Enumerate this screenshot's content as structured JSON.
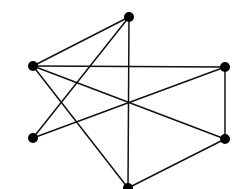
{
  "graph": {
    "colors": {
      "background": "#ffffff",
      "edge": "#111111",
      "node": "#000000"
    },
    "node_radius": 5,
    "nodes": [
      {
        "id": "top",
        "x": 129,
        "y": 17
      },
      {
        "id": "left-upper",
        "x": 33,
        "y": 66
      },
      {
        "id": "right-upper",
        "x": 225,
        "y": 67
      },
      {
        "id": "left-lower",
        "x": 33,
        "y": 138
      },
      {
        "id": "right-lower",
        "x": 225,
        "y": 139
      },
      {
        "id": "bottom",
        "x": 128,
        "y": 188
      }
    ],
    "edges": [
      {
        "from": "top",
        "to": "left-upper"
      },
      {
        "from": "top",
        "to": "left-lower"
      },
      {
        "from": "top",
        "to": "bottom"
      },
      {
        "from": "left-upper",
        "to": "right-upper"
      },
      {
        "from": "left-upper",
        "to": "right-lower"
      },
      {
        "from": "left-upper",
        "to": "bottom"
      },
      {
        "from": "left-lower",
        "to": "right-upper"
      },
      {
        "from": "right-upper",
        "to": "right-lower"
      },
      {
        "from": "right-lower",
        "to": "bottom"
      }
    ]
  }
}
